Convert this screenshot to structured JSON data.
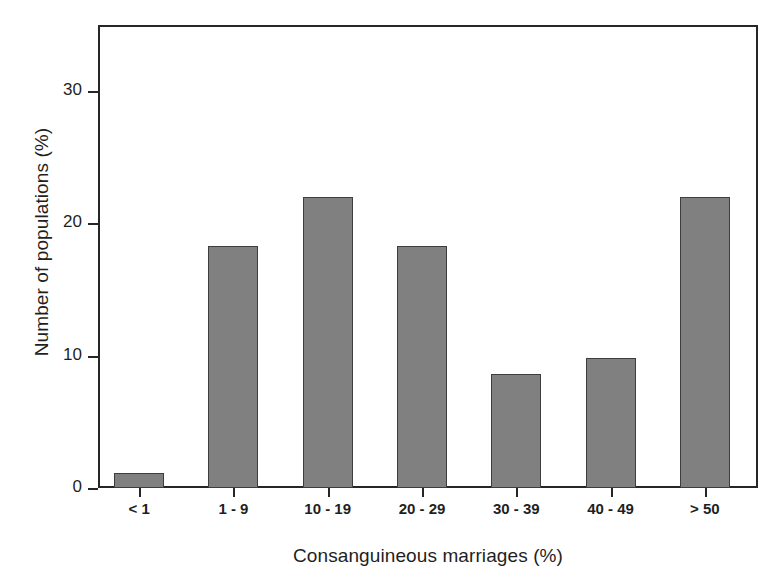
{
  "chart_data": {
    "type": "bar",
    "title": "",
    "xlabel": "Consanguineous marriages (%)",
    "ylabel": "Number of populations (%)",
    "categories": [
      "< 1",
      "1 - 9",
      "10 - 19",
      "20 - 29",
      "30 - 39",
      "40 - 49",
      "> 50"
    ],
    "values": [
      1.1,
      18.3,
      22.0,
      18.3,
      8.6,
      9.8,
      22.0
    ],
    "ylim": [
      0,
      35
    ],
    "yticks": [
      0,
      10,
      20,
      30
    ],
    "ytick_labels": [
      "0",
      "10",
      "20",
      "30"
    ],
    "grid": false,
    "legend": false,
    "bar_color": "#808080",
    "bar_edge_color": "#3d3d3d",
    "axis_color": "#262626",
    "background": "#ffffff"
  }
}
